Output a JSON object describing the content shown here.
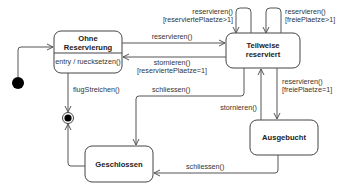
{
  "diagram": {
    "type": "UML state machine",
    "colors": {
      "stroke": "#444444",
      "text": "#222222",
      "background": "#ffffff",
      "initial_fill": "#000000"
    },
    "states": [
      {
        "id": "ohne",
        "name_line1": "Ohne",
        "name_line2": "Reservierung",
        "internal": "entry / ruecksetzen()"
      },
      {
        "id": "teilweise",
        "name_line1": "Teilweise",
        "name_line2": "reserviert"
      },
      {
        "id": "ausgebucht",
        "name": "Ausgebucht"
      },
      {
        "id": "geschlossen",
        "name": "Geschlossen"
      }
    ],
    "pseudo_states": {
      "initial": "initial-state",
      "final": "final-state"
    },
    "transitions": {
      "ohne_to_teilweise": {
        "event": "reservieren()"
      },
      "teilweise_to_ohne": {
        "event": "stornieren()",
        "guard": "[reserviertePlaetze=1]"
      },
      "teilweise_self_1": {
        "event": "reservieren()",
        "guard": "[reserviertePlaetze>1]"
      },
      "teilweise_self_2": {
        "event": "reservieren()",
        "guard": "[freiePlaetze>1]"
      },
      "teilweise_to_ausgebucht": {
        "event": "reservieren()",
        "guard": "[freiePlaetze=1]"
      },
      "ausgebucht_to_teilweise": {
        "event": "stornieren()"
      },
      "teilweise_to_geschlossen": {
        "event": "schliessen()"
      },
      "ausgebucht_to_geschlossen": {
        "event": "schliessen()"
      },
      "ohne_to_final": {
        "event": "flugStreichen()"
      },
      "geschlossen_to_final": {
        "event": ""
      }
    }
  }
}
